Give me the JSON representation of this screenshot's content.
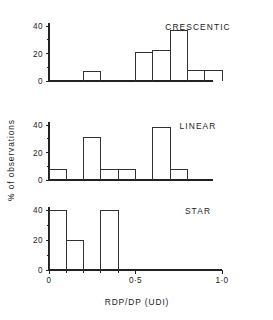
{
  "figure": {
    "background": "#ffffff",
    "ink_color": "#222222"
  },
  "axis": {
    "xlabel": "RDP/DP  (UDI)",
    "ylabel": "% of observations",
    "x_ticks": [
      {
        "value": 0.0,
        "label": "0"
      },
      {
        "value": 0.5,
        "label": "0·5"
      },
      {
        "value": 1.0,
        "label": "1·0"
      }
    ],
    "x_minor_ticks": [
      0.1,
      0.2,
      0.3,
      0.4,
      0.6,
      0.7,
      0.8,
      0.9
    ],
    "y_ticks": [
      {
        "value": 0,
        "label": "0"
      },
      {
        "value": 20,
        "label": "20"
      },
      {
        "value": 40,
        "label": "40"
      }
    ],
    "y_minor_ticks": [
      10,
      30
    ],
    "xlim": [
      0.0,
      1.0
    ],
    "ylim": [
      0,
      42
    ]
  },
  "chart_data": {
    "type": "bar",
    "title": "",
    "subtitle": "",
    "xlabel": "RDP/DP  (UDI)",
    "ylabel": "% of observations",
    "xlim": [
      0.0,
      1.0
    ],
    "ylim": [
      0,
      42
    ],
    "grid": false,
    "legend_position": "none",
    "bin_width": 0.1,
    "orientation": "vertical",
    "panels": [
      {
        "name": "crescentic",
        "label": "CRESCENTIC",
        "categories": [
          "0.0-0.1",
          "0.1-0.2",
          "0.2-0.3",
          "0.3-0.4",
          "0.4-0.5",
          "0.5-0.6",
          "0.6-0.7",
          "0.7-0.8",
          "0.8-0.9",
          "0.9-1.0"
        ],
        "bin_starts": [
          0.0,
          0.1,
          0.2,
          0.3,
          0.4,
          0.5,
          0.6,
          0.7,
          0.8,
          0.9
        ],
        "values": [
          0,
          0,
          7,
          0,
          0,
          21,
          22,
          37,
          8,
          8
        ]
      },
      {
        "name": "linear",
        "label": "LINEAR",
        "categories": [
          "0.0-0.1",
          "0.1-0.2",
          "0.2-0.3",
          "0.3-0.4",
          "0.4-0.5",
          "0.5-0.6",
          "0.6-0.7",
          "0.7-0.8",
          "0.8-0.9",
          "0.9-1.0"
        ],
        "bin_starts": [
          0.0,
          0.1,
          0.2,
          0.3,
          0.4,
          0.5,
          0.6,
          0.7,
          0.8,
          0.9
        ],
        "values": [
          8,
          0,
          31,
          8,
          8,
          0,
          38,
          8,
          0,
          0
        ]
      },
      {
        "name": "star",
        "label": "STAR",
        "categories": [
          "0.0-0.1",
          "0.1-0.2",
          "0.2-0.3",
          "0.3-0.4",
          "0.4-0.5",
          "0.5-0.6",
          "0.6-0.7",
          "0.7-0.8",
          "0.8-0.9",
          "0.9-1.0"
        ],
        "bin_starts": [
          0.0,
          0.1,
          0.2,
          0.3,
          0.4,
          0.5,
          0.6,
          0.7,
          0.8,
          0.9
        ],
        "values": [
          40,
          20,
          0,
          40,
          0,
          0,
          0,
          0,
          0,
          0
        ]
      }
    ]
  }
}
